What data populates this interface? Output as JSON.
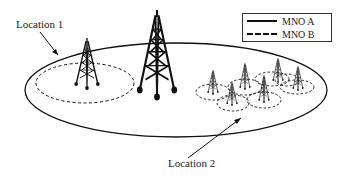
{
  "diagram": {
    "labels": {
      "location1": "Location 1",
      "location2": "Location 2"
    },
    "legend": {
      "items": [
        {
          "label": "MNO A",
          "style": "solid"
        },
        {
          "label": "MNO B",
          "style": "dashed"
        }
      ]
    },
    "colors": {
      "stroke": "#111111",
      "background": "#ffffff"
    }
  }
}
